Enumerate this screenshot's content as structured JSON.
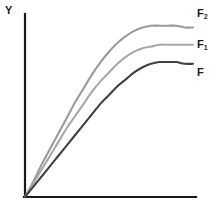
{
  "figure": {
    "background_color": "#ffffff",
    "width": 218,
    "height": 214
  },
  "axes": {
    "y_label": "Y",
    "x_label": "",
    "axis_color": "#1a1a1a",
    "origin": {
      "x": 25,
      "y": 197
    },
    "y_axis_top": {
      "x": 25,
      "y": 14
    },
    "x_axis_right": {
      "x": 196,
      "y": 197
    }
  },
  "labels": {
    "f2": {
      "base": "F",
      "sub": "2"
    },
    "f1": {
      "base": "F",
      "sub": "1"
    },
    "f": {
      "base": "F",
      "sub": ""
    }
  },
  "chart_data": {
    "type": "line",
    "title": "",
    "xlabel": "",
    "ylabel": "Y",
    "grid": false,
    "legend_position": "right-inline",
    "xlim": [
      0,
      100
    ],
    "ylim": [
      0,
      100
    ],
    "x": [
      0,
      5,
      10,
      15,
      20,
      25,
      30,
      35,
      40,
      45,
      50,
      55,
      60,
      65,
      70,
      75,
      80,
      85,
      90,
      95,
      100
    ],
    "series": [
      {
        "name": "F2",
        "label": "F₂",
        "color": "#9a9a9a",
        "plateau": 99,
        "values": [
          0,
          9,
          19,
          28,
          37,
          46,
          55,
          63,
          71,
          78,
          84,
          89,
          93,
          96,
          98,
          99,
          99,
          99,
          99,
          98,
          98
        ]
      },
      {
        "name": "F1",
        "label": "F₁",
        "color": "#a8a8a8",
        "plateau": 88,
        "values": [
          0,
          8,
          16,
          24,
          32,
          40,
          47,
          54,
          61,
          67,
          72,
          77,
          81,
          84,
          86,
          87,
          88,
          88,
          88,
          88,
          88
        ]
      },
      {
        "name": "F",
        "label": "F",
        "color": "#414141",
        "plateau": 78,
        "values": [
          0,
          6,
          12,
          18,
          24,
          30,
          36,
          42,
          48,
          54,
          59,
          64,
          68,
          72,
          75,
          77,
          78,
          78,
          78,
          77,
          77
        ]
      }
    ]
  }
}
